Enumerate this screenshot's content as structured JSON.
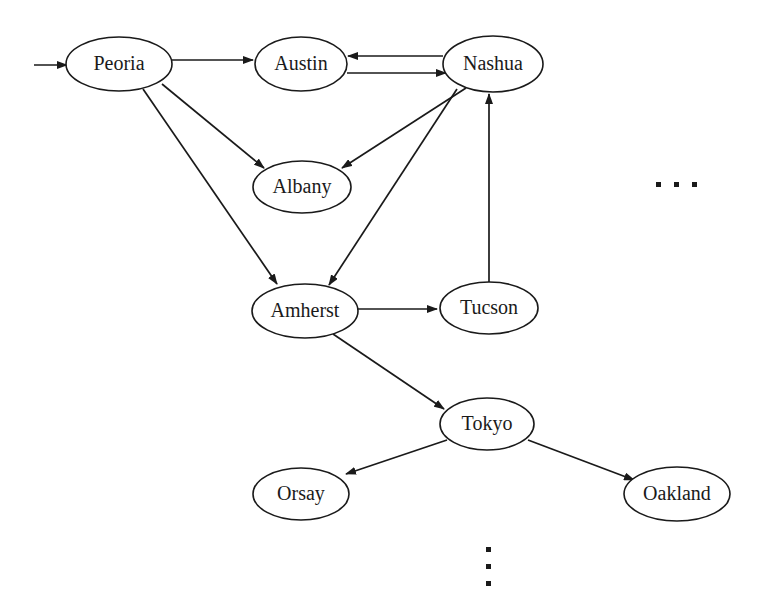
{
  "diagram": {
    "background_color": "#ffffff",
    "stroke_color": "#1a1a1a",
    "node_fill_color": "#ffffff",
    "nodes": [
      {
        "id": "peoria",
        "label": "Peoria",
        "cx": 119,
        "cy": 64,
        "rx": 53,
        "ry": 27
      },
      {
        "id": "austin",
        "label": "Austin",
        "cx": 301,
        "cy": 64,
        "rx": 46,
        "ry": 27
      },
      {
        "id": "nashua",
        "label": "Nashua",
        "cx": 493,
        "cy": 64,
        "rx": 50,
        "ry": 28
      },
      {
        "id": "albany",
        "label": "Albany",
        "cx": 302,
        "cy": 187,
        "rx": 49,
        "ry": 26
      },
      {
        "id": "amherst",
        "label": "Amherst",
        "cx": 305,
        "cy": 311,
        "rx": 53,
        "ry": 27
      },
      {
        "id": "tucson",
        "label": "Tucson",
        "cx": 489,
        "cy": 308,
        "rx": 49,
        "ry": 26
      },
      {
        "id": "tokyo",
        "label": "Tokyo",
        "cx": 487,
        "cy": 424,
        "rx": 47,
        "ry": 26
      },
      {
        "id": "orsay",
        "label": "Orsay",
        "cx": 301,
        "cy": 494,
        "rx": 48,
        "ry": 26
      },
      {
        "id": "oakland",
        "label": "Oakland",
        "cx": 677,
        "cy": 494,
        "rx": 53,
        "ry": 27
      }
    ],
    "edges": [
      {
        "id": "entry-peoria",
        "from": "",
        "to": "peoria",
        "label": ""
      },
      {
        "id": "peoria-austin",
        "from": "peoria",
        "to": "austin",
        "label": ""
      },
      {
        "id": "peoria-albany",
        "from": "peoria",
        "to": "albany",
        "label": ""
      },
      {
        "id": "peoria-amherst",
        "from": "peoria",
        "to": "amherst",
        "label": ""
      },
      {
        "id": "austin-nashua",
        "from": "austin",
        "to": "nashua",
        "label": ""
      },
      {
        "id": "nashua-austin",
        "from": "nashua",
        "to": "austin",
        "label": ""
      },
      {
        "id": "nashua-albany",
        "from": "nashua",
        "to": "albany",
        "label": ""
      },
      {
        "id": "nashua-amherst",
        "from": "nashua",
        "to": "amherst",
        "label": ""
      },
      {
        "id": "amherst-tucson",
        "from": "amherst",
        "to": "tucson",
        "label": ""
      },
      {
        "id": "tucson-nashua",
        "from": "tucson",
        "to": "nashua",
        "label": ""
      },
      {
        "id": "amherst-tokyo",
        "from": "amherst",
        "to": "tokyo",
        "label": ""
      },
      {
        "id": "tokyo-orsay",
        "from": "tokyo",
        "to": "orsay",
        "label": ""
      },
      {
        "id": "tokyo-oakland",
        "from": "tokyo",
        "to": "oakland",
        "label": ""
      }
    ],
    "ellipses_marks": [
      {
        "id": "horizontal-ellipsis",
        "orientation": "horizontal",
        "text": "...",
        "x": 676,
        "y": 185
      },
      {
        "id": "vertical-ellipsis",
        "orientation": "vertical",
        "text": "...",
        "x": 488,
        "y": 565
      }
    ]
  }
}
